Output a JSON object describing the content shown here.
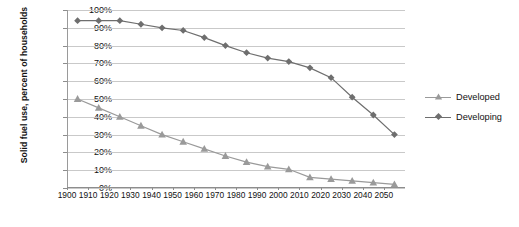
{
  "chart_data": {
    "type": "line",
    "title": "",
    "xlabel": "",
    "ylabel": "Solid fuel use, percent of households",
    "ylim": [
      0,
      100
    ],
    "xlim": [
      1900,
      2060
    ],
    "grid": true,
    "legend_position": "right",
    "y_ticks": [
      "0%",
      "10%",
      "20%",
      "30%",
      "40%",
      "50%",
      "60%",
      "70%",
      "80%",
      "90%",
      "100%"
    ],
    "y_tick_values": [
      0,
      10,
      20,
      30,
      40,
      50,
      60,
      70,
      80,
      90,
      100
    ],
    "x_ticks": [
      "1900",
      "1910",
      "1920",
      "1930",
      "1940",
      "1950",
      "1960",
      "1970",
      "1980",
      "1990",
      "2000",
      "2010",
      "2020",
      "2030",
      "2040",
      "2050"
    ],
    "x_tick_values": [
      1900,
      1910,
      1920,
      1930,
      1940,
      1950,
      1960,
      1970,
      1980,
      1990,
      2000,
      2010,
      2020,
      2030,
      2040,
      2050
    ],
    "x": [
      1905,
      1915,
      1925,
      1935,
      1945,
      1955,
      1965,
      1975,
      1985,
      1995,
      2005,
      2015,
      2025,
      2035,
      2045,
      2055
    ],
    "series": [
      {
        "name": "Developed",
        "marker": "triangle",
        "color": "#9a9a9a",
        "line_color": "#9a9a9a",
        "values": [
          50,
          45,
          40,
          35,
          30,
          26,
          22,
          18,
          14.5,
          12,
          10.5,
          6,
          5,
          4,
          3,
          2
        ]
      },
      {
        "name": "Developing",
        "marker": "diamond",
        "color": "#6e6e6e",
        "line_color": "#6e6e6e",
        "values": [
          94,
          94,
          94,
          92,
          90,
          88.5,
          84.5,
          80,
          76,
          73,
          71,
          67.5,
          62,
          51,
          41,
          30
        ]
      }
    ]
  },
  "legend": {
    "items": [
      {
        "label": "Developed"
      },
      {
        "label": "Developing"
      }
    ]
  },
  "colors": {
    "developed": "#9a9a9a",
    "developing": "#6e6e6e",
    "gridline": "#c9c9c9",
    "axis": "#8d8d8d",
    "text": "#111111",
    "background": "#ffffff"
  }
}
